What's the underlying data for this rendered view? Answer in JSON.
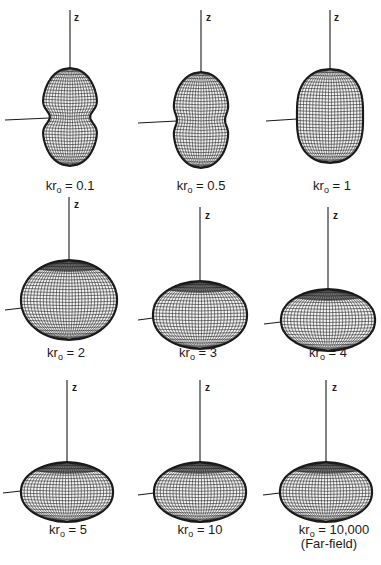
{
  "figure": {
    "axis_label": "z",
    "colors": {
      "wire": "#1a1a1a",
      "background": "#ffffff"
    }
  },
  "panels": [
    {
      "id": "p1",
      "kr": "0.1",
      "label_prefix": "kr",
      "label_sub": "o",
      "label_value": "= 0.1",
      "shape": "peanut",
      "cx": 70,
      "ztop": 10,
      "cy": 117,
      "rx": 28,
      "ry": 49,
      "waist": 0.72,
      "hx0": 5,
      "hy": 118,
      "lx": 70,
      "ly": 178,
      "zx": 74,
      "zy": 12
    },
    {
      "id": "p2",
      "kr": "0.5",
      "label_prefix": "kr",
      "label_sub": "o",
      "label_value": "= 0.5",
      "shape": "peanut",
      "cx": 201,
      "ztop": 10,
      "cy": 120,
      "rx": 28,
      "ry": 48,
      "waist": 0.86,
      "hx0": 138,
      "hy": 121,
      "lx": 201,
      "ly": 178,
      "zx": 206,
      "zy": 12
    },
    {
      "id": "p3",
      "kr": "1",
      "label_prefix": "kr",
      "label_sub": "o",
      "label_value": "= 1",
      "shape": "oval",
      "cx": 330,
      "ztop": 10,
      "cy": 116,
      "rx": 33,
      "ry": 47,
      "waist": 1,
      "hx0": 266,
      "hy": 119,
      "lx": 332,
      "ly": 178,
      "zx": 334,
      "zy": 12
    },
    {
      "id": "p4",
      "kr": "2",
      "label_prefix": "kr",
      "label_sub": "o",
      "label_value": "= 2",
      "shape": "sphere",
      "cx": 69,
      "ztop": 197,
      "cy": 300,
      "rx": 48,
      "ry": 40,
      "waist": 1,
      "hx0": 5,
      "hy": 308,
      "lx": 66,
      "ly": 345,
      "zx": 74,
      "zy": 199
    },
    {
      "id": "p5",
      "kr": "3",
      "label_prefix": "kr",
      "label_sub": "o",
      "label_value": "= 3",
      "shape": "torus",
      "cx": 200,
      "ztop": 207,
      "cy": 315,
      "rx": 47,
      "ry": 34,
      "waist": 1,
      "hx0": 138,
      "hy": 318,
      "lx": 198,
      "ly": 345,
      "zx": 205,
      "zy": 210
    },
    {
      "id": "p6",
      "kr": "4",
      "label_prefix": "kr",
      "label_sub": "o",
      "label_value": "= 4",
      "shape": "torus",
      "cx": 328,
      "ztop": 207,
      "cy": 320,
      "rx": 47,
      "ry": 31,
      "waist": 1,
      "hx0": 264,
      "hy": 322,
      "lx": 328,
      "ly": 345,
      "zx": 333,
      "zy": 210
    },
    {
      "id": "p7",
      "kr": "5",
      "label_prefix": "kr",
      "label_sub": "o",
      "label_value": "= 5",
      "shape": "torus",
      "cx": 67,
      "ztop": 380,
      "cy": 492,
      "rx": 46,
      "ry": 30,
      "waist": 1,
      "hx0": 3,
      "hy": 491,
      "lx": 68,
      "ly": 522,
      "zx": 72,
      "zy": 382
    },
    {
      "id": "p8",
      "kr": "10",
      "label_prefix": "kr",
      "label_sub": "o",
      "label_value": "= 10",
      "shape": "torus",
      "cx": 200,
      "ztop": 380,
      "cy": 492,
      "rx": 46,
      "ry": 30,
      "waist": 1,
      "hx0": 138,
      "hy": 493,
      "lx": 200,
      "ly": 522,
      "zx": 205,
      "zy": 382
    },
    {
      "id": "p9",
      "kr": "10,000",
      "label_prefix": "kr",
      "label_sub": "o",
      "label_value": "= 10,000",
      "label_note": "(Far-field)",
      "shape": "torus",
      "cx": 326,
      "ztop": 380,
      "cy": 492,
      "rx": 46,
      "ry": 30,
      "waist": 1,
      "hx0": 263,
      "hy": 493,
      "lx": 334,
      "ly": 522,
      "zx": 332,
      "zy": 382
    }
  ]
}
